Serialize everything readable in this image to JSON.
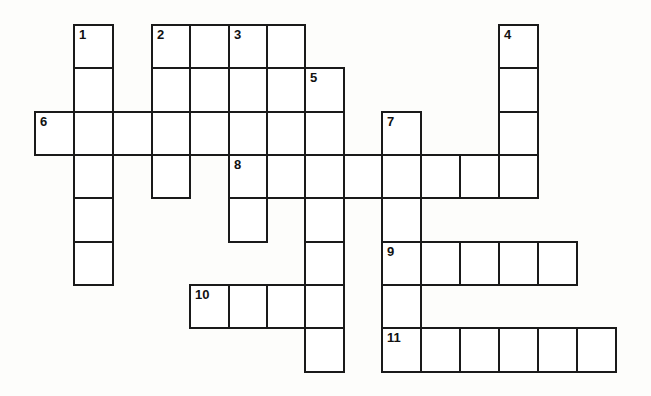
{
  "puzzle": {
    "type": "crossword",
    "grid": {
      "col_x": [
        35,
        74,
        113,
        152,
        190,
        229,
        267,
        305,
        344,
        382,
        421,
        460,
        499,
        538,
        577
      ],
      "row_y": [
        25,
        68,
        112,
        155,
        198,
        242,
        285,
        328
      ],
      "cell_w": 39,
      "cell_h": 44
    },
    "cells": [
      {
        "r": 0,
        "c": 1,
        "num": "1"
      },
      {
        "r": 0,
        "c": 3,
        "num": "2"
      },
      {
        "r": 0,
        "c": 4
      },
      {
        "r": 0,
        "c": 5,
        "num": "3"
      },
      {
        "r": 0,
        "c": 6
      },
      {
        "r": 0,
        "c": 12,
        "num": "4"
      },
      {
        "r": 1,
        "c": 1
      },
      {
        "r": 1,
        "c": 3
      },
      {
        "r": 1,
        "c": 4
      },
      {
        "r": 1,
        "c": 5
      },
      {
        "r": 1,
        "c": 6
      },
      {
        "r": 1,
        "c": 7,
        "num": "5"
      },
      {
        "r": 1,
        "c": 12
      },
      {
        "r": 2,
        "c": 0,
        "num": "6"
      },
      {
        "r": 2,
        "c": 1
      },
      {
        "r": 2,
        "c": 2
      },
      {
        "r": 2,
        "c": 3
      },
      {
        "r": 2,
        "c": 4
      },
      {
        "r": 2,
        "c": 5
      },
      {
        "r": 2,
        "c": 6
      },
      {
        "r": 2,
        "c": 7
      },
      {
        "r": 2,
        "c": 9,
        "num": "7"
      },
      {
        "r": 2,
        "c": 12
      },
      {
        "r": 3,
        "c": 1
      },
      {
        "r": 3,
        "c": 3
      },
      {
        "r": 3,
        "c": 5,
        "num": "8"
      },
      {
        "r": 3,
        "c": 6
      },
      {
        "r": 3,
        "c": 7
      },
      {
        "r": 3,
        "c": 8
      },
      {
        "r": 3,
        "c": 9
      },
      {
        "r": 3,
        "c": 10
      },
      {
        "r": 3,
        "c": 11
      },
      {
        "r": 3,
        "c": 12
      },
      {
        "r": 4,
        "c": 1
      },
      {
        "r": 4,
        "c": 5
      },
      {
        "r": 4,
        "c": 7
      },
      {
        "r": 4,
        "c": 9
      },
      {
        "r": 5,
        "c": 1
      },
      {
        "r": 5,
        "c": 7
      },
      {
        "r": 5,
        "c": 9,
        "num": "9"
      },
      {
        "r": 5,
        "c": 10
      },
      {
        "r": 5,
        "c": 11
      },
      {
        "r": 5,
        "c": 12
      },
      {
        "r": 5,
        "c": 13
      },
      {
        "r": 6,
        "c": 4,
        "num": "10"
      },
      {
        "r": 6,
        "c": 5
      },
      {
        "r": 6,
        "c": 6
      },
      {
        "r": 6,
        "c": 7
      },
      {
        "r": 6,
        "c": 9
      },
      {
        "r": 7,
        "c": 7
      },
      {
        "r": 7,
        "c": 9,
        "num": "11"
      },
      {
        "r": 7,
        "c": 10
      },
      {
        "r": 7,
        "c": 11
      },
      {
        "r": 7,
        "c": 12
      },
      {
        "r": 7,
        "c": 13
      },
      {
        "r": 7,
        "c": 14
      }
    ],
    "entries": {
      "across": [
        {
          "num": "2",
          "row": 0,
          "col": 3,
          "length": 4
        },
        {
          "num": "6",
          "row": 2,
          "col": 0,
          "length": 8
        },
        {
          "num": "8",
          "row": 3,
          "col": 5,
          "length": 8
        },
        {
          "num": "9",
          "row": 5,
          "col": 9,
          "length": 5
        },
        {
          "num": "10",
          "row": 6,
          "col": 4,
          "length": 4
        },
        {
          "num": "11",
          "row": 7,
          "col": 9,
          "length": 6
        }
      ],
      "down": [
        {
          "num": "1",
          "row": 0,
          "col": 1,
          "length": 6
        },
        {
          "num": "2",
          "row": 0,
          "col": 3,
          "length": 4
        },
        {
          "num": "3",
          "row": 0,
          "col": 5,
          "length": 5
        },
        {
          "num": "4",
          "row": 0,
          "col": 12,
          "length": 4
        },
        {
          "num": "5",
          "row": 1,
          "col": 7,
          "length": 7
        },
        {
          "num": "7",
          "row": 2,
          "col": 9,
          "length": 6
        }
      ]
    },
    "colors": {
      "line": "#1a1a1a",
      "cell": "#ffffff",
      "background": "#fdfdfb"
    }
  }
}
